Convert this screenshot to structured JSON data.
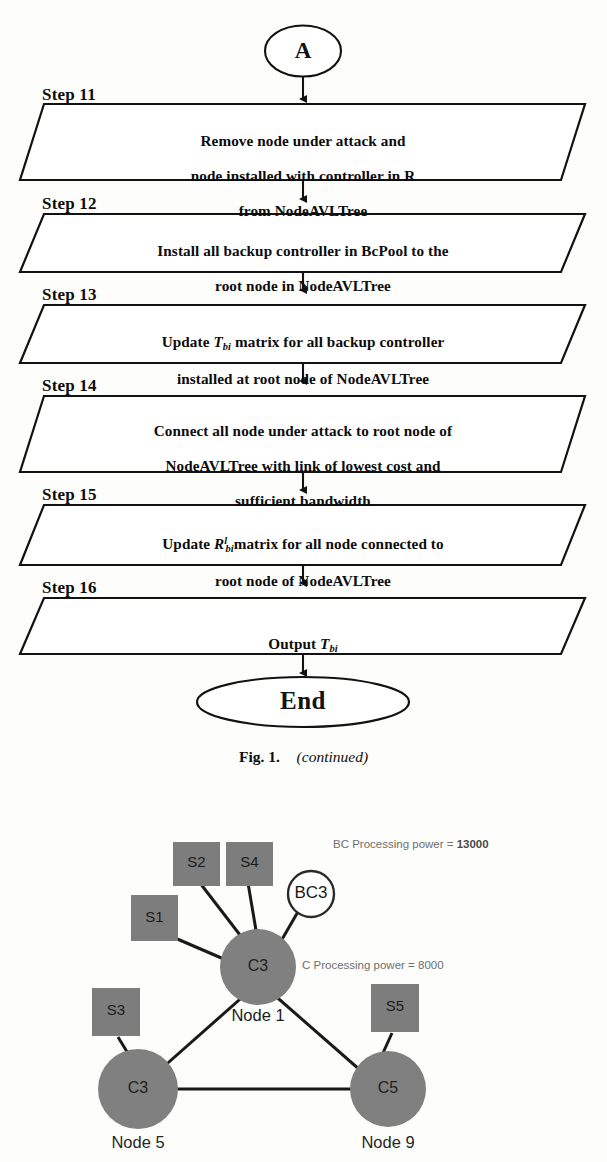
{
  "flowchart": {
    "connector_top": "A",
    "terminator_end": "End",
    "steps": [
      {
        "step_label": "Step 11",
        "lines": [
          "Remove node under attack and",
          "node installed with controller in R",
          "from NodeAVLTree"
        ]
      },
      {
        "step_label": "Step 12",
        "lines": [
          "Install all backup controller in BcPool to the",
          "root node in NodeAVLTree"
        ]
      },
      {
        "step_label": "Step 13",
        "lines": [
          "Update T_bi matrix for all backup controller",
          "installed at root node of NodeAVLTree"
        ],
        "math": {
          "base": "T",
          "sub": "bi",
          "sup": ""
        },
        "line1_before": "Update ",
        "line1_after": " matrix for all backup controller",
        "line2": "installed at root node of NodeAVLTree"
      },
      {
        "step_label": "Step 14",
        "lines": [
          "Connect all node under attack to root node of",
          "NodeAVLTree with link of lowest cost and",
          "sufficient bandwidth"
        ]
      },
      {
        "step_label": "Step 15",
        "lines": [
          "Update R^l_bi matrix for all node connected to",
          "root node of NodeAVLTree"
        ],
        "math": {
          "base": "R",
          "sub": "bi",
          "sup": "l"
        },
        "line1_before": "Update ",
        "line1_after": "matrix for all node connected to",
        "line2": "root node of NodeAVLTree"
      },
      {
        "step_label": "Step 16",
        "lines": [
          "Output T_bi"
        ],
        "math": {
          "base": "T",
          "sub": "bi",
          "sup": ""
        },
        "line1_before": "Output ",
        "line1_after": ""
      }
    ]
  },
  "caption": {
    "label": "Fig. 1.",
    "note": "(continued)"
  },
  "network": {
    "annotations": {
      "bc_power_prefix": "BC Processing power = ",
      "bc_power_value": "13000",
      "c_power": "C Processing power = 8000"
    },
    "nodes": [
      {
        "id": "node1",
        "inner": "C3",
        "caption": "Node 1",
        "type": "controller"
      },
      {
        "id": "node5",
        "inner": "C3",
        "caption": "Node 5",
        "type": "controller"
      },
      {
        "id": "node9",
        "inner": "C5",
        "caption": "Node 9",
        "type": "controller"
      }
    ],
    "backup_controller": {
      "inner": "BC3"
    },
    "servers": [
      {
        "inner": "S1"
      },
      {
        "inner": "S2"
      },
      {
        "inner": "S4"
      },
      {
        "inner": "S3"
      },
      {
        "inner": "S5"
      }
    ],
    "colors": {
      "node_fill": "#808080",
      "server_fill": "#7d7d7d",
      "backup_fill": "#ffffff",
      "stroke": "#1a1a1a",
      "annotation_text": "#6f6f6f"
    }
  }
}
